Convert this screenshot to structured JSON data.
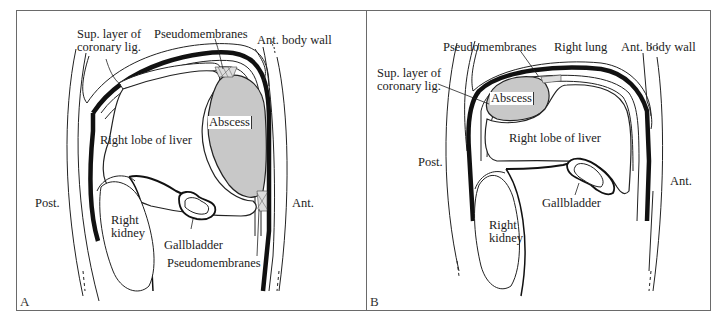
{
  "figure": {
    "panels": [
      {
        "id": "A",
        "letter": "A",
        "labels": {
          "sup_layer_line1": "Sup. layer of",
          "sup_layer_line2": "coronary lig.",
          "pseudomembranes_top": "Pseudomembranes",
          "ant_body_wall": "Ant. body wall",
          "abscess": "Abscess",
          "right_lobe": "Right lobe of liver",
          "post": "Post.",
          "ant": "Ant.",
          "right_kidney_line1": "Right",
          "right_kidney_line2": "kidney",
          "gallbladder": "Gallbladder",
          "pseudomembranes_bottom": "Pseudomembranes"
        }
      },
      {
        "id": "B",
        "letter": "B",
        "labels": {
          "pseudomembranes_top": "Pseudomembranes",
          "right_lung": "Right lung",
          "ant_body_wall": "Ant. body wall",
          "sup_layer_line1": "Sup. layer of",
          "sup_layer_line2": "coronary lig.",
          "abscess": "Abscess",
          "right_lobe": "Right lobe of liver",
          "post": "Post.",
          "ant": "Ant.",
          "gallbladder": "Gallbladder",
          "right_kidney_line1": "Right",
          "right_kidney_line2": "kidney"
        }
      }
    ],
    "colors": {
      "abscess_fill": "#c8c8c8",
      "line": "#111111",
      "frame": "#6a6a6a"
    }
  }
}
